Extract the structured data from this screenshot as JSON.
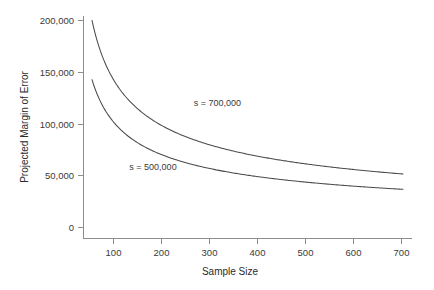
{
  "chart_data": {
    "type": "line",
    "title": "",
    "xlabel": "Sample Size",
    "ylabel": "Projected Margin of Error",
    "xlim": [
      47,
      700
    ],
    "ylim": [
      0,
      200000
    ],
    "grid": false,
    "legend_position": "inline-annotation",
    "x_ticks": [
      100,
      200,
      300,
      400,
      500,
      600,
      700
    ],
    "x_tick_labels": [
      "100",
      "200",
      "300",
      "400",
      "500",
      "600",
      "700"
    ],
    "y_ticks": [
      0,
      50000,
      100000,
      150000,
      200000
    ],
    "y_tick_labels": [
      "0",
      "50,000",
      "100,000",
      "150,000",
      "200,000"
    ],
    "annotations": [
      {
        "text": "s = 700,000",
        "x": 310,
        "y": 118000
      },
      {
        "text": "s = 500,000",
        "x": 175,
        "y": 56000
      }
    ],
    "series": [
      {
        "name": "s = 700,000",
        "formula": "1.96 * 700000 / sqrt(n)",
        "color": "#4a4a4a",
        "x": [
          47,
          60,
          80,
          100,
          125,
          150,
          175,
          200,
          250,
          300,
          350,
          400,
          450,
          500,
          550,
          600,
          650,
          700
        ],
        "values": [
          200065,
          177100,
          153385,
          137200,
          122715,
          112028,
          103720,
          97015,
          86773,
          79212,
          73335,
          68600,
          64676,
          61356,
          58500,
          56014,
          53818,
          51867
        ]
      },
      {
        "name": "s = 500,000",
        "formula": "1.96 * 500000 / sqrt(n)",
        "color": "#4a4a4a",
        "x": [
          47,
          60,
          80,
          100,
          125,
          150,
          175,
          200,
          250,
          300,
          350,
          400,
          450,
          500,
          550,
          600,
          650,
          700
        ],
        "values": [
          142904,
          126500,
          109561,
          98000,
          87654,
          80020,
          74086,
          69296,
          61981,
          56580,
          52382,
          49000,
          46197,
          43826,
          41786,
          40010,
          38441,
          37048
        ]
      }
    ]
  },
  "axes": {
    "x_title": "Sample Size",
    "y_title": "Projected Margin of Error"
  },
  "colors": {
    "curve": "#4a4a4a",
    "axis": "#8d8d8d",
    "text": "#3a3a3a",
    "background": "#ffffff"
  }
}
